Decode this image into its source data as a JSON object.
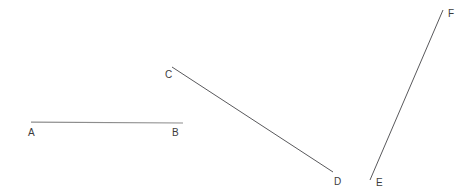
{
  "figure": {
    "width": 471,
    "height": 195,
    "background_color": "#ffffff",
    "label_color": "#3c3c3c",
    "segments": [
      {
        "id": "AB",
        "name": "segment-ab",
        "color": "#8d8d8d",
        "stroke_width": 1.2,
        "x1": 31,
        "y1": 122.2,
        "x2": 183,
        "y2": 123.0,
        "start_label": "A",
        "end_label": "B"
      },
      {
        "id": "CD",
        "name": "segment-cd",
        "color": "#59595c",
        "stroke_width": 1.0,
        "x1": 172,
        "y1": 67,
        "x2": 333,
        "y2": 172,
        "start_label": "C",
        "end_label": "D"
      },
      {
        "id": "EF",
        "name": "segment-ef",
        "color": "#59595c",
        "stroke_width": 1.0,
        "x1": 370,
        "y1": 180,
        "x2": 443,
        "y2": 10,
        "start_label": "E",
        "end_label": "F"
      }
    ],
    "labels": [
      {
        "text": "A",
        "x": 28,
        "y": 128
      },
      {
        "text": "B",
        "x": 172,
        "y": 128
      },
      {
        "text": "C",
        "x": 165,
        "y": 70
      },
      {
        "text": "D",
        "x": 334,
        "y": 177
      },
      {
        "text": "E",
        "x": 376,
        "y": 178
      },
      {
        "text": "F",
        "x": 448,
        "y": 9
      }
    ]
  }
}
